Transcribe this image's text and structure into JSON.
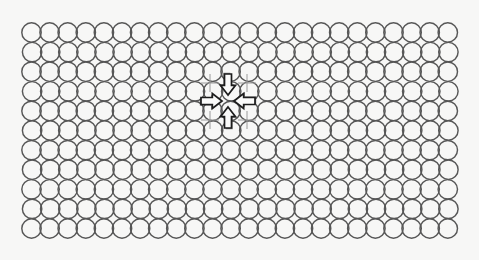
{
  "figure": {
    "canvas": {
      "width": 479,
      "height": 260,
      "background_color": "#f7f7f6"
    },
    "lattice": {
      "shape_name": "circle",
      "columns": 24,
      "rows": 11,
      "circle_diameter": 19.4,
      "circle_radius": 9.7,
      "stroke_color": "#575757",
      "stroke_width": 1.45,
      "fill": "none",
      "origin_x": 31.5,
      "origin_y": 32.5,
      "step_x": 18.1,
      "step_y": 19.6,
      "row_offset_x": 0.6,
      "packing": "close-packed-touching"
    },
    "arrows": {
      "count": 4,
      "fill_color": "#fbfbfa",
      "outline_color": "#1d1d1d",
      "converge_point_x": 228,
      "converge_point_y": 101,
      "directions": [
        {
          "name": "arrow-down",
          "points_toward": "center",
          "from": "top"
        },
        {
          "name": "arrow-up",
          "points_toward": "center",
          "from": "bottom"
        },
        {
          "name": "arrow-right",
          "points_toward": "center",
          "from": "left"
        },
        {
          "name": "arrow-left",
          "points_toward": "center",
          "from": "right"
        }
      ],
      "shaft_width": 7,
      "head_width": 15,
      "length": 21
    },
    "crosshairs": {
      "count": 4,
      "color": "#9a9a9a",
      "arm_length": 9,
      "positions": [
        {
          "x": 210,
          "y": 83
        },
        {
          "x": 247,
          "y": 83
        },
        {
          "x": 210,
          "y": 120
        },
        {
          "x": 247,
          "y": 120
        }
      ]
    }
  }
}
